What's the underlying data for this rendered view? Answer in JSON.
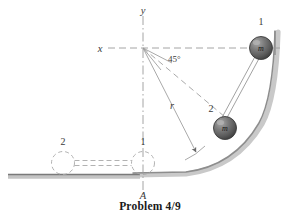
{
  "figure": {
    "caption": "Problem 4/9",
    "background_color": "#ffffff",
    "ink_color": "#555555",
    "ball_color": "#5e5e5e",
    "ball_highlight_color": "#9a9a9a",
    "ground_color": "#6b6b6b"
  },
  "axes": {
    "x_label": "x",
    "y_label": "y",
    "origin_label": "",
    "angle_label": "45°",
    "radius_label": "r"
  },
  "points": {
    "pivot_label": "A"
  },
  "balls": [
    {
      "id": "ball-1",
      "index_label": "1",
      "mass_label": "m",
      "state": "upper-on-ramp"
    },
    {
      "id": "ball-2",
      "index_label": "2",
      "mass_label": "m",
      "state": "lower-on-ramp"
    }
  ],
  "ghost_positions": [
    {
      "id": "ghost-2",
      "index_label": "2",
      "state": "dashed-outline-left"
    },
    {
      "id": "ghost-1",
      "index_label": "1",
      "state": "dashed-outline-at-A"
    }
  ]
}
